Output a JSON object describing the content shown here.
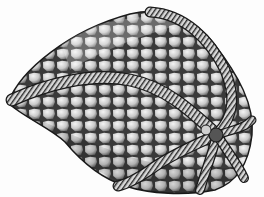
{
  "image": {
    "subject": "stippled scientific illustration of a fossil echinoderm (edrioasteroid-like theca) with polygonal plates and five curving ambulacral arms",
    "width": 264,
    "height": 197,
    "colors": {
      "background": "#fdfdfd",
      "ink": "#1a1a1a",
      "plate_fill": "#d6d6d6",
      "plate_shade": "#8a8a8a",
      "arm_fill": "#bdbdbd"
    }
  }
}
